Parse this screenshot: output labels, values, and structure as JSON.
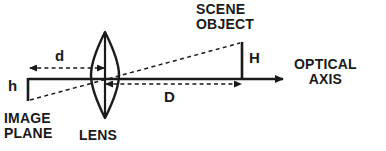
{
  "figure": {
    "background_color": "#ffffff",
    "stroke_color": "#1a1a1a",
    "width": 386,
    "height": 151
  },
  "labels": {
    "scene_object_line1": "SCENE",
    "scene_object_line2": "OBJECT",
    "optical_axis_line1": "OPTICAL",
    "optical_axis_line2": "AXIS",
    "image_plane_line1": "IMAGE",
    "image_plane_line2": "PLANE",
    "lens": "LENS",
    "image_distance": "d",
    "image_height": "h",
    "object_height": "H",
    "object_distance": "D"
  },
  "elements": {
    "optical_axis": "horizontal-solid-line-with-right-arrow",
    "lens": "biconvex-lens-with-vertical-centerline",
    "object_bar": "vertical-solid-bar-above-axis",
    "image_bar": "vertical-solid-bar-below-axis",
    "chief_ray": "dashed-line-through-lens-center",
    "d_dimension": "dashed-double-headed-arrow",
    "D_dimension": "dashed-double-headed-arrow"
  }
}
